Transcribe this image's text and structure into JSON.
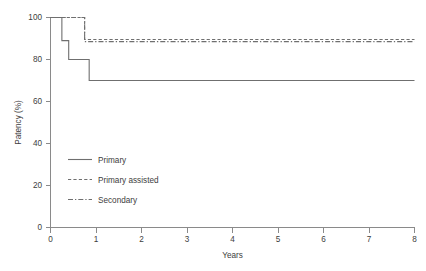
{
  "chart_data": {
    "type": "line",
    "title": "",
    "subtitle": "",
    "xlabel": "Years",
    "ylabel": "Patency (%)",
    "xlim": [
      0,
      8
    ],
    "ylim": [
      0,
      100
    ],
    "xticks": [
      "0",
      "1",
      "2",
      "3",
      "4",
      "5",
      "6",
      "7",
      "8"
    ],
    "yticks": [
      "0",
      "20",
      "40",
      "60",
      "80",
      "100"
    ],
    "grid": false,
    "legend_position": "inside lower-left",
    "step_type": "post",
    "series": [
      {
        "name": "Primary",
        "linestyle": "solid",
        "color": "#6f6f6f",
        "x": [
          0,
          0.25,
          0.4,
          0.85,
          8
        ],
        "y": [
          100,
          89,
          80,
          70,
          70
        ]
      },
      {
        "name": "Primary assisted",
        "linestyle": "dashed",
        "color": "#6f6f6f",
        "x": [
          0,
          0.75,
          8
        ],
        "y": [
          100,
          89.5,
          89.5
        ]
      },
      {
        "name": "Secondary",
        "linestyle": "dashdot",
        "color": "#6f6f6f",
        "x": [
          0,
          0.75,
          8
        ],
        "y": [
          100,
          88.5,
          88.5
        ]
      }
    ]
  },
  "axes": {
    "y_label": "Patency (%)",
    "x_label": "Years",
    "y_tick_0": "0",
    "y_tick_20": "20",
    "y_tick_40": "40",
    "y_tick_60": "60",
    "y_tick_80": "80",
    "y_tick_100": "100",
    "x_tick_0": "0",
    "x_tick_1": "1",
    "x_tick_2": "2",
    "x_tick_3": "3",
    "x_tick_4": "4",
    "x_tick_5": "5",
    "x_tick_6": "6",
    "x_tick_7": "7",
    "x_tick_8": "8"
  },
  "legend": {
    "entries": [
      {
        "label": "Primary",
        "style": "solid"
      },
      {
        "label": "Primary assisted",
        "style": "dashed"
      },
      {
        "label": "Secondary",
        "style": "dashdot"
      }
    ]
  }
}
